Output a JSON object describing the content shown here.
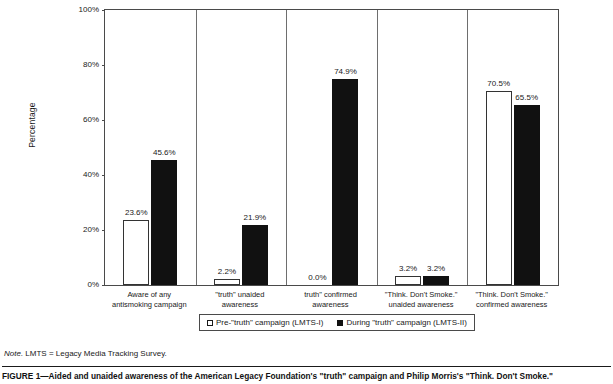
{
  "chart_data": {
    "type": "bar",
    "title": "",
    "xlabel": "",
    "ylabel": "Percentage",
    "ylim": [
      0,
      100
    ],
    "yticks": [
      "0%",
      "20%",
      "40%",
      "60%",
      "80%",
      "100%"
    ],
    "ytick_values": [
      0,
      20,
      40,
      60,
      80,
      100
    ],
    "grid": false,
    "legend_position": "bottom-center",
    "categories": [
      "Aware of any antismoking campaign",
      "\"truth\" unaided awareness",
      "truth\" confirmed awareness",
      "\"Think. Don't Smoke.\" unaided awareness",
      "\"Think. Don't Smoke.\" confirmed awareness"
    ],
    "category_lines": [
      [
        "Aware of any",
        "antismoking campaign"
      ],
      [
        "\"truth\" unaided",
        "awareness"
      ],
      [
        "truth\" confirmed",
        "awareness"
      ],
      [
        "\"Think. Don't Smoke.\"",
        "unaided awareness"
      ],
      [
        "\"Think. Don't Smoke.\"",
        "confirmed awareness"
      ]
    ],
    "series": [
      {
        "name": "Pre-\"truth\" campaign (LMTS-I)",
        "color": "#ffffff",
        "values": [
          23.6,
          2.2,
          0.0,
          3.2,
          70.5
        ],
        "labels": [
          "23.6%",
          "2.2%",
          "0.0%",
          "3.2%",
          "70.5%"
        ]
      },
      {
        "name": "During \"truth\" campaign (LMTS-II)",
        "color": "#111111",
        "values": [
          45.6,
          21.9,
          74.9,
          3.2,
          65.5
        ],
        "labels": [
          "45.6%",
          "21.9%",
          "74.9%",
          "3.2%",
          "65.5%"
        ]
      }
    ]
  },
  "legend": {
    "items": [
      {
        "label": "Pre-\"truth\" campaign (LMTS-I)",
        "swatch": "pre"
      },
      {
        "label": "During \"truth\" campaign (LMTS-II)",
        "swatch": "during"
      }
    ]
  },
  "note": {
    "prefix": "Note.",
    "text": "LMTS = Legacy Media Tracking Survey."
  },
  "caption": {
    "text": "FIGURE 1—Aided and unaided awareness of the American Legacy Foundation's \"truth\" campaign and Philip Morris's \"Think. Don't Smoke.\""
  }
}
